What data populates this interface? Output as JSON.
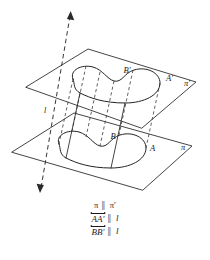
{
  "figure": {
    "type": "geometry-diagram"
  },
  "labels": {
    "upper_plane": "π′",
    "lower_plane": "π",
    "upper_point_a": "A′",
    "upper_point_b": "B′",
    "lower_point_a": "A",
    "lower_point_b": "B",
    "transversal_line": "l"
  },
  "caption": {
    "line1": {
      "left": "π",
      "symbol": "∥",
      "right": "π′"
    },
    "line2": {
      "left": "AA′",
      "symbol": "∥",
      "right": "l"
    },
    "line3": {
      "left": "BB′",
      "symbol": "∥",
      "right": "l"
    }
  },
  "colors": {
    "stroke": "#232323",
    "dashed": "#3a3a3a",
    "background": "#ffffff",
    "parallel_symbol": "#6f6f6f"
  },
  "geometry": {
    "upper_plane_corners": [
      [
        26,
        87
      ],
      [
        88,
        49
      ],
      [
        196,
        82
      ],
      [
        142,
        128
      ]
    ],
    "lower_plane_corners": [
      [
        12,
        152
      ],
      [
        74,
        113
      ],
      [
        192,
        146
      ],
      [
        143,
        190
      ]
    ],
    "axis_start": [
      70,
      12
    ],
    "axis_end": [
      40,
      192
    ]
  }
}
